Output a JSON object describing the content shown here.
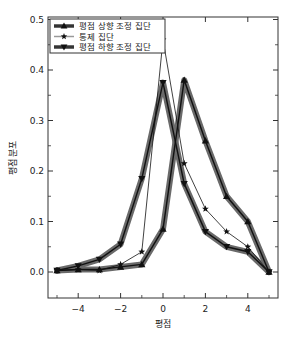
{
  "chart_data": {
    "type": "line",
    "title": "",
    "xlabel": "평점",
    "ylabel": "평점 분포",
    "xlim": [
      -5.4,
      5.4
    ],
    "ylim": [
      -0.05,
      0.5
    ],
    "xticks": [
      -4,
      -2,
      0,
      2,
      4
    ],
    "xtick_labels": [
      "−4",
      "−2",
      "0",
      "2",
      "4"
    ],
    "yticks": [
      0.0,
      0.1,
      0.2,
      0.3,
      0.4,
      0.5
    ],
    "ytick_labels": [
      "0.0",
      "0.1",
      "0.2",
      "0.3",
      "0.4",
      "0.5"
    ],
    "grid": false,
    "legend_position": "upper left",
    "x": [
      -5,
      -4,
      -3,
      -2,
      -1,
      0,
      1,
      2,
      3,
      4,
      5
    ],
    "series": [
      {
        "name": "평점 상향 조정 집단",
        "marker": "triangle-up",
        "band": true,
        "values": [
          0.003,
          0.005,
          0.005,
          0.01,
          0.015,
          0.085,
          0.38,
          0.26,
          0.15,
          0.1,
          0.0
        ]
      },
      {
        "name": "통제 집단",
        "marker": "star",
        "band": false,
        "values": [
          0.003,
          0.005,
          0.003,
          0.015,
          0.04,
          0.46,
          0.215,
          0.125,
          0.08,
          0.05,
          0.0
        ]
      },
      {
        "name": "평점 하향 조정 집단",
        "marker": "triangle-down",
        "band": true,
        "values": [
          0.003,
          0.012,
          0.025,
          0.055,
          0.185,
          0.375,
          0.175,
          0.08,
          0.05,
          0.04,
          0.0
        ]
      }
    ]
  },
  "colors": {
    "line": "#111111",
    "band": "#6a6a6a",
    "frame": "#333333"
  }
}
